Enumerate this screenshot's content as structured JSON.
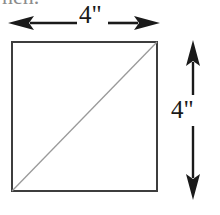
{
  "figure": {
    "name": "square-with-diagonal-dimension-diagram",
    "background_color": "#ffffff",
    "clipped_header_text": "nen.",
    "square": {
      "name": "square-outline",
      "stroke_color": "#3d3d3d",
      "fill_color": "#ffffff",
      "stroke_width": 2,
      "left": 11,
      "top": 41,
      "width": 147,
      "height": 151
    },
    "diagonal": {
      "name": "diagonal-line",
      "description": "diagonal from bottom-left corner to top-right corner",
      "stroke_color": "#8f8f8f",
      "stroke_width": 1.2,
      "x1": 11,
      "y1": 192,
      "x2": 158,
      "y2": 41
    },
    "width_arrow": {
      "name": "width-dimension-arrow",
      "orientation": "horizontal",
      "color": "#1a1a1a",
      "label": "4\"",
      "x_start": 8,
      "x_end": 160,
      "y": 23
    },
    "height_arrow": {
      "name": "height-dimension-arrow",
      "orientation": "vertical",
      "color": "#1a1a1a",
      "label": "4\"",
      "y_start": 40,
      "y_end": 200,
      "x": 193
    }
  }
}
